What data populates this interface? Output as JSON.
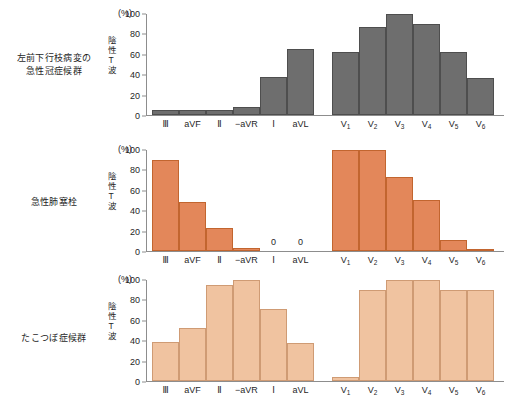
{
  "figure": {
    "unit_label": "(%)",
    "y_axis_title": "陰性T波",
    "y_ticks": [
      0,
      20,
      40,
      60,
      80,
      100
    ]
  },
  "chart_data": [
    {
      "type": "bar",
      "title": "左前下行枝病変の 急性冠症候群",
      "title_lines": [
        "左前下行枝病変の",
        "急性冠症候群"
      ],
      "ylabel": "陰性T波",
      "xlabel": "",
      "unit": "(%)",
      "ylim": [
        0,
        100
      ],
      "yticks": [
        0,
        20,
        40,
        60,
        80,
        100
      ],
      "grid": false,
      "legend": "none",
      "bar_color": "#6e6e6e",
      "categories": [
        "Ⅲ",
        "aVF",
        "Ⅱ",
        "−aVR",
        "Ⅰ",
        "aVL",
        "V1",
        "V2",
        "V3",
        "V4",
        "V5",
        "V6"
      ],
      "values": [
        5,
        5,
        5,
        8,
        37,
        65,
        62,
        86,
        99,
        89,
        62,
        36
      ]
    },
    {
      "type": "bar",
      "title": "急性肺塞栓",
      "title_lines": [
        "急性肺塞栓"
      ],
      "ylabel": "陰性T波",
      "xlabel": "",
      "unit": "(%)",
      "ylim": [
        0,
        100
      ],
      "yticks": [
        0,
        20,
        40,
        60,
        80,
        100
      ],
      "grid": false,
      "legend": "none",
      "bar_color": "#e3875a",
      "categories": [
        "Ⅲ",
        "aVF",
        "Ⅱ",
        "−aVR",
        "Ⅰ",
        "aVL",
        "V1",
        "V2",
        "V3",
        "V4",
        "V5",
        "V6"
      ],
      "values": [
        89,
        48,
        23,
        3,
        0,
        0,
        99,
        99,
        73,
        50,
        11,
        2
      ],
      "value_labels": {
        "4": "0",
        "5": "0"
      }
    },
    {
      "type": "bar",
      "title": "たこつぼ症候群",
      "title_lines": [
        "たこつぼ症候群"
      ],
      "ylabel": "陰性T波",
      "xlabel": "",
      "unit": "(%)",
      "ylim": [
        0,
        100
      ],
      "yticks": [
        0,
        20,
        40,
        60,
        80,
        100
      ],
      "grid": false,
      "legend": "none",
      "bar_color": "#f0c3a0",
      "categories": [
        "Ⅲ",
        "aVF",
        "Ⅱ",
        "−aVR",
        "Ⅰ",
        "aVL",
        "V1",
        "V2",
        "V3",
        "V4",
        "V5",
        "V6"
      ],
      "values": [
        38,
        52,
        94,
        99,
        71,
        37,
        4,
        89,
        99,
        99,
        89,
        89
      ]
    }
  ],
  "lead_labels": [
    {
      "main": "Ⅲ",
      "sub": ""
    },
    {
      "main": "aVF",
      "sub": ""
    },
    {
      "main": "Ⅱ",
      "sub": ""
    },
    {
      "main": "−aVR",
      "sub": ""
    },
    {
      "main": "Ⅰ",
      "sub": ""
    },
    {
      "main": "aVL",
      "sub": ""
    },
    {
      "main": "V",
      "sub": "1"
    },
    {
      "main": "V",
      "sub": "2"
    },
    {
      "main": "V",
      "sub": "3"
    },
    {
      "main": "V",
      "sub": "4"
    },
    {
      "main": "V",
      "sub": "5"
    },
    {
      "main": "V",
      "sub": "6"
    }
  ]
}
